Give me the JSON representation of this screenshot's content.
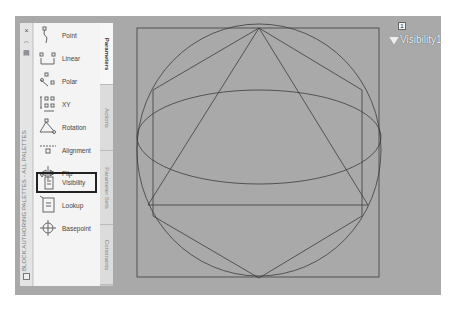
{
  "palette": {
    "title": "BLOCK AUTHORING PALETTES - ALL PALETTES",
    "controls": {
      "close": "×",
      "autohide": "⇔",
      "properties": "▤"
    },
    "items": [
      {
        "label": "Point",
        "icon": "point-parameter-icon"
      },
      {
        "label": "Linear",
        "icon": "linear-parameter-icon"
      },
      {
        "label": "Polar",
        "icon": "polar-parameter-icon"
      },
      {
        "label": "XY",
        "icon": "xy-parameter-icon"
      },
      {
        "label": "Rotation",
        "icon": "rotation-parameter-icon"
      },
      {
        "label": "Alignment",
        "icon": "alignment-parameter-icon"
      },
      {
        "label": "Flip",
        "icon": "flip-parameter-icon"
      },
      {
        "label": "Visibility",
        "icon": "visibility-parameter-icon",
        "selected": true
      },
      {
        "label": "Lookup",
        "icon": "lookup-parameter-icon"
      },
      {
        "label": "Basepoint",
        "icon": "basepoint-parameter-icon"
      }
    ],
    "tabs": [
      {
        "label": "Parameters",
        "active": true
      },
      {
        "label": "Actions"
      },
      {
        "label": "Parameter Sets"
      },
      {
        "label": "Constraints"
      }
    ]
  },
  "canvas": {
    "background": "#a9a9a9",
    "visibility_parameter": {
      "badge": "1",
      "label": "Visibility1"
    }
  }
}
